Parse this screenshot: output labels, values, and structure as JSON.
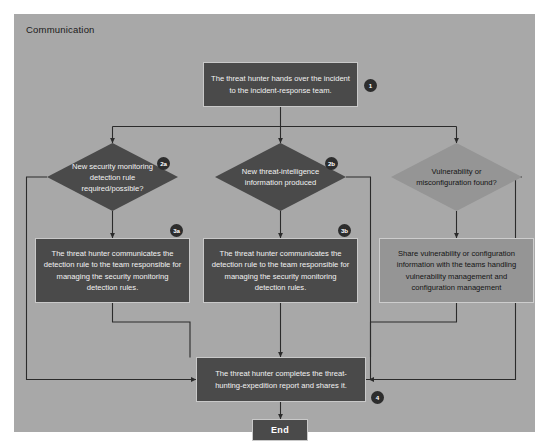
{
  "diagram": {
    "type": "flowchart",
    "lane_title": "Communication",
    "colors": {
      "lane_background": "#a8a8a8",
      "node_dark": "#4a4a4a",
      "node_light": "#959595",
      "node_dark_text": "#f2f2f2",
      "node_light_text": "#141414",
      "connector": "#2b2b2b",
      "badge_background": "#2d2d2d",
      "badge_text": "#ffffff",
      "page_background": "#ffffff"
    },
    "nodes": {
      "handover": {
        "label": "The threat hunter hands over the incident to the incident-response team.",
        "badge": "1",
        "shape": "process",
        "style": "dark"
      },
      "decision_detection_rule": {
        "label": "New security monitoring detection rule required/possible?",
        "badge": "2a",
        "shape": "decision",
        "style": "dark"
      },
      "decision_threat_intel": {
        "label": "New threat-intelligence information produced",
        "badge": "2b",
        "shape": "decision",
        "style": "dark"
      },
      "decision_vulnerability": {
        "label": "Vulnerability or misconfiguration found?",
        "badge": "",
        "shape": "decision",
        "style": "light"
      },
      "communicate_rule_a": {
        "label": "The threat hunter communicates the detection rule to the team responsible for managing the security monitoring detection rules.",
        "badge": "3a",
        "shape": "process",
        "style": "dark"
      },
      "communicate_rule_b": {
        "label": "The threat hunter communicates the detection rule to the team responsible for managing the security monitoring detection rules.",
        "badge": "3b",
        "shape": "process",
        "style": "dark"
      },
      "share_vulnerability": {
        "label": "Share vulnerability or configuration information with the teams handling vulnerability management and configuration management",
        "badge": "",
        "shape": "process",
        "style": "light"
      },
      "complete_report": {
        "label": "The threat hunter completes the threat-hunting-expedition report and shares it.",
        "badge": "4",
        "shape": "process",
        "style": "dark"
      },
      "end": {
        "label": "End",
        "badge": "",
        "shape": "terminator",
        "style": "dark"
      }
    }
  }
}
